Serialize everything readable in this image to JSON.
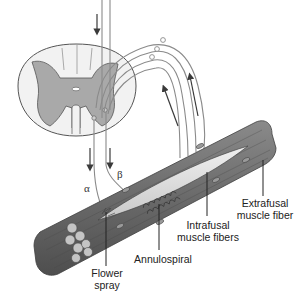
{
  "diagram": {
    "colors": {
      "gray_matter": "#a9a9a9",
      "white_matter": "#f2f2f2",
      "outline": "#555555",
      "nerve": "#8a8a8a",
      "arrow": "#3a3a3a",
      "muscle_dark": "#5a5a5a",
      "muscle_mid": "#7d7d7d",
      "muscle_light": "#b5b5b5",
      "spindle_light": "#e6e6e6",
      "text": "#222222"
    },
    "labels": {
      "alpha": "α",
      "beta": "β",
      "flower_spray_line1": "Flower",
      "flower_spray_line2": "spray",
      "annulospiral": "Annulospiral",
      "intrafusal_line1": "Intrafusal",
      "intrafusal_line2": "muscle fibers",
      "extrafusal_line1": "Extrafusal",
      "extrafusal_line2": "muscle fiber"
    },
    "components": [
      "spinal-cord-cross-section",
      "descending-motor-fibers",
      "afferent-sensory-fibers",
      "dorsal-root-ganglion-cells",
      "muscle-fiber-bundle",
      "intrafusal-spindle"
    ]
  }
}
